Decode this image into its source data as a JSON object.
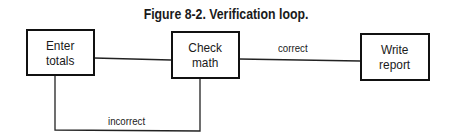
{
  "figure": {
    "title": "Figure 8-2.  Verification loop."
  },
  "nodes": [
    {
      "id": "enter",
      "line1": "Enter",
      "line2": "totals"
    },
    {
      "id": "check",
      "line1": "Check",
      "line2": "math"
    },
    {
      "id": "write",
      "line1": "Write",
      "line2": "report"
    }
  ],
  "edges": {
    "correct_label": "correct",
    "incorrect_label": "incorrect"
  }
}
